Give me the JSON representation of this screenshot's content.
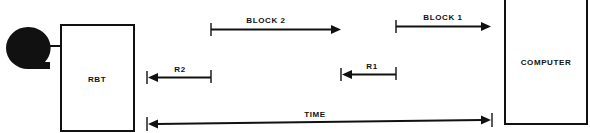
{
  "diagram": {
    "title": "",
    "colors": {
      "ink": "#111111",
      "background": "#ffffff"
    },
    "nodes": {
      "reel": {
        "label": "",
        "icon": "tape-reel-icon"
      },
      "rbt": {
        "label": "RBT"
      },
      "computer": {
        "label": "COMPUTER"
      }
    },
    "arrows": {
      "block2": {
        "label": "BLOCK 2",
        "direction": "right"
      },
      "block1": {
        "label": "BLOCK 1",
        "direction": "right"
      },
      "r2": {
        "label": "R2",
        "direction": "left"
      },
      "r1": {
        "label": "R1",
        "direction": "left"
      },
      "time": {
        "label": "TIME",
        "direction": "both"
      }
    }
  }
}
